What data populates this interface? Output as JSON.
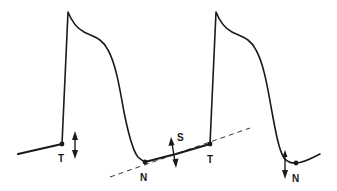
{
  "diagram": {
    "type": "action-potential-waveform",
    "labels": {
      "threshold_1": "T",
      "nadir_1": "N",
      "slope": "S",
      "threshold_2": "T",
      "nadir_2": "N"
    },
    "colors": {
      "line": "#1a1a1a",
      "background": "#ffffff"
    }
  }
}
